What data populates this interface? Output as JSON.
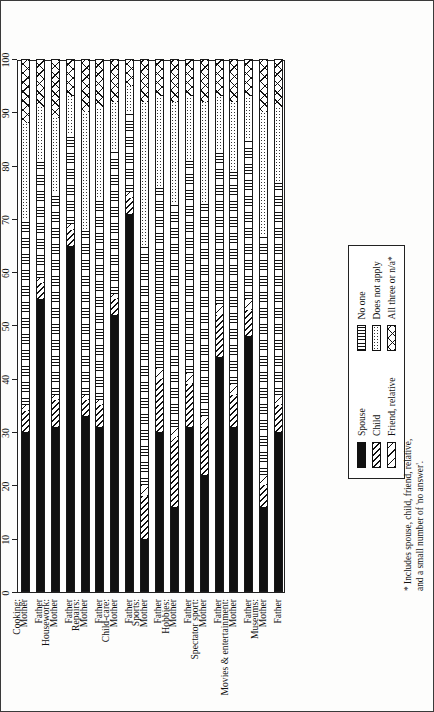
{
  "figure": {
    "title": "FIGURE 2: Co-participants in selected activities, first child 16 years of age or younger, in percent",
    "footnote_line1": "* Includes spouse, child, friend, relative,",
    "footnote_line2": "and a small number of 'no answer'."
  },
  "legend": {
    "left": [
      {
        "label": "Spouse",
        "pattern": "p-spouse"
      },
      {
        "label": "Child",
        "pattern": "p-child"
      },
      {
        "label": "Friend, relative",
        "pattern": "p-friend"
      }
    ],
    "right": [
      {
        "label": "No one",
        "pattern": "p-noone"
      },
      {
        "label": "Does not apply",
        "pattern": "p-na"
      },
      {
        "label": "All three or n/a*",
        "pattern": "p-all"
      }
    ]
  },
  "chart_data": {
    "type": "bar",
    "orientation": "horizontal-stacked-100",
    "title": "FIGURE 2: Co-participants in selected activities, first child 16 years of age or younger, in percent",
    "xlabel": "",
    "ylabel": "",
    "xlim": [
      0,
      100
    ],
    "xticks": [
      0,
      10,
      20,
      30,
      40,
      50,
      60,
      70,
      80,
      90,
      100
    ],
    "grid": false,
    "legend_position": "inside-bottom-right",
    "series": [
      {
        "name": "Spouse",
        "pattern": "p-spouse"
      },
      {
        "name": "Child",
        "pattern": "p-child"
      },
      {
        "name": "Friend, relative",
        "pattern": "p-friend"
      },
      {
        "name": "No one",
        "pattern": "p-noone"
      },
      {
        "name": "Does not apply",
        "pattern": "p-na"
      },
      {
        "name": "All three or n/a*",
        "pattern": "p-all"
      }
    ],
    "groups": [
      {
        "group": "Cooking:",
        "rows": [
          "Mother",
          "Father"
        ]
      },
      {
        "group": "Housework:",
        "rows": [
          "Mother",
          "Father"
        ]
      },
      {
        "group": "Repairs:",
        "rows": [
          "Mother",
          "Father"
        ]
      },
      {
        "group": "Child-care:",
        "rows": [
          "Mother",
          "Father"
        ]
      },
      {
        "group": "Sports:",
        "rows": [
          "Mother",
          "Father"
        ]
      },
      {
        "group": "Hobbies:",
        "rows": [
          "Mother",
          "Father"
        ]
      },
      {
        "group": "Spectator sport:",
        "rows": [
          "Mother",
          "Father"
        ]
      },
      {
        "group": "Movies & entertainment:",
        "rows": [
          "Mother",
          "Father"
        ]
      },
      {
        "group": "Museums:",
        "rows": [
          "Mother",
          "Father"
        ]
      }
    ],
    "categories": [
      "Cooking: Mother",
      "Cooking: Father",
      "Housework: Mother",
      "Housework: Father",
      "Repairs: Mother",
      "Repairs: Father",
      "Child-care: Mother",
      "Child-care: Father",
      "Sports: Mother",
      "Sports: Father",
      "Hobbies: Mother",
      "Hobbies: Father",
      "Spectator sport: Mother",
      "Spectator sport: Father",
      "Movies & entertainment: Mother",
      "Movies & entertainment: Father",
      "Museums: Mother",
      "Museums: Father"
    ],
    "rows": [
      {
        "label": "Mother",
        "group": "Cooking:",
        "values": [
          30,
          4,
          1,
          35,
          18,
          12
        ]
      },
      {
        "label": "Father",
        "group": "Cooking:",
        "values": [
          55,
          3,
          1,
          22,
          10,
          9
        ]
      },
      {
        "label": "Mother",
        "group": "Housework:",
        "values": [
          31,
          5,
          1,
          38,
          14,
          11
        ]
      },
      {
        "label": "Father",
        "group": "Housework:",
        "values": [
          65,
          3,
          1,
          17,
          7,
          7
        ]
      },
      {
        "label": "Mother",
        "group": "Repairs:",
        "values": [
          33,
          3,
          1,
          31,
          22,
          10
        ]
      },
      {
        "label": "Father",
        "group": "Repairs:",
        "values": [
          31,
          4,
          1,
          38,
          17,
          9
        ]
      },
      {
        "label": "Mother",
        "group": "Child-care:",
        "values": [
          52,
          3,
          1,
          27,
          9,
          8
        ]
      },
      {
        "label": "Father",
        "group": "Child-care:",
        "values": [
          71,
          3,
          1,
          15,
          5,
          5
        ]
      },
      {
        "label": "Mother",
        "group": "Sports:",
        "values": [
          10,
          8,
          2,
          45,
          27,
          8
        ]
      },
      {
        "label": "Father",
        "group": "Sports:",
        "values": [
          30,
          10,
          2,
          34,
          17,
          7
        ]
      },
      {
        "label": "Mother",
        "group": "Hobbies:",
        "values": [
          16,
          13,
          2,
          42,
          19,
          8
        ]
      },
      {
        "label": "Father",
        "group": "Hobbies:",
        "values": [
          31,
          8,
          2,
          40,
          12,
          7
        ]
      },
      {
        "label": "Mother",
        "group": "Spectator sport:",
        "values": [
          22,
          9,
          2,
          40,
          19,
          8
        ]
      },
      {
        "label": "Father",
        "group": "Spectator sport:",
        "values": [
          44,
          8,
          2,
          29,
          10,
          7
        ]
      },
      {
        "label": "Mother",
        "group": "Movies & entertainment:",
        "values": [
          31,
          6,
          2,
          40,
          13,
          8
        ]
      },
      {
        "label": "Father",
        "group": "Movies & entertainment:",
        "values": [
          48,
          5,
          2,
          30,
          8,
          7
        ]
      },
      {
        "label": "Mother",
        "group": "Museums:",
        "values": [
          16,
          4,
          2,
          45,
          23,
          10
        ]
      },
      {
        "label": "Father",
        "group": "Museums:",
        "values": [
          30,
          5,
          2,
          40,
          14,
          9
        ]
      }
    ]
  }
}
